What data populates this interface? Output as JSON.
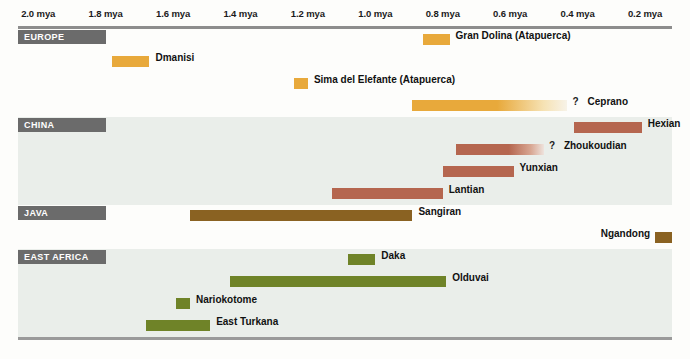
{
  "chart_data": {
    "type": "bar",
    "orientation": "horizontal-timeline",
    "title": "",
    "xlabel": "",
    "ylabel": "",
    "axis": {
      "unit": "mya",
      "ticks": [
        "2.0 mya",
        "1.8 mya",
        "1.6 mya",
        "1.4 mya",
        "1.2 mya",
        "1.0 mya",
        "0.8 mya",
        "0.6 mya",
        "0.4 mya",
        "0.2 mya"
      ],
      "tick_values": [
        2.0,
        1.8,
        1.6,
        1.4,
        1.2,
        1.0,
        0.8,
        0.6,
        0.4,
        0.2
      ],
      "xlim": [
        2.06,
        0.12
      ],
      "direction": "oldest-left",
      "grid": true,
      "legend": "none"
    },
    "colors": {
      "europe": "#e8a93b",
      "china": "#b5664f",
      "java": "#8a6222",
      "east_africa": "#6f8328",
      "section_header": "#6b6b6b",
      "shaded_band": "#eaeeea",
      "plain_band": "#fdfdfb",
      "axis_rule": "#8d8d8d"
    },
    "regions": [
      {
        "name": "EUROPE",
        "shaded": false,
        "color": "#e8a93b",
        "bars": [
          {
            "label": "Gran Dolina (Atapuerca)",
            "start_mya": 0.86,
            "end_mya": 0.78,
            "uncertain": false,
            "label_side": "right"
          },
          {
            "label": "Dmanisi",
            "start_mya": 1.78,
            "end_mya": 1.67,
            "uncertain": false,
            "label_side": "right"
          },
          {
            "label": "Sima del Elefante (Atapuerca)",
            "start_mya": 1.24,
            "end_mya": 1.2,
            "uncertain": false,
            "label_side": "right"
          },
          {
            "label": "Ceprano",
            "start_mya": 0.89,
            "end_mya": 0.43,
            "uncertain": true,
            "label_side": "right"
          }
        ]
      },
      {
        "name": "CHINA",
        "shaded": true,
        "color": "#b5664f",
        "bars": [
          {
            "label": "Hexian",
            "start_mya": 0.41,
            "end_mya": 0.21,
            "uncertain": false,
            "label_side": "right"
          },
          {
            "label": "Zhoukoudian",
            "start_mya": 0.76,
            "end_mya": 0.5,
            "uncertain": true,
            "label_side": "right"
          },
          {
            "label": "Yunxian",
            "start_mya": 0.8,
            "end_mya": 0.59,
            "uncertain": false,
            "label_side": "right"
          },
          {
            "label": "Lantian",
            "start_mya": 1.13,
            "end_mya": 0.8,
            "uncertain": false,
            "label_side": "right"
          }
        ]
      },
      {
        "name": "JAVA",
        "shaded": false,
        "color": "#8a6222",
        "bars": [
          {
            "label": "Sangiran",
            "start_mya": 1.55,
            "end_mya": 0.89,
            "uncertain": false,
            "label_side": "right"
          },
          {
            "label": "Ngandong",
            "start_mya": 0.17,
            "end_mya": 0.12,
            "uncertain": false,
            "label_side": "left"
          }
        ]
      },
      {
        "name": "EAST AFRICA",
        "shaded": true,
        "color": "#6f8328",
        "bars": [
          {
            "label": "Daka",
            "start_mya": 1.08,
            "end_mya": 1.0,
            "uncertain": false,
            "label_side": "right"
          },
          {
            "label": "Olduvai",
            "start_mya": 1.43,
            "end_mya": 0.79,
            "uncertain": false,
            "label_side": "right"
          },
          {
            "label": "Nariokotome",
            "start_mya": 1.59,
            "end_mya": 1.55,
            "uncertain": false,
            "label_side": "right"
          },
          {
            "label": "East Turkana",
            "start_mya": 1.68,
            "end_mya": 1.49,
            "uncertain": false,
            "label_side": "right"
          }
        ]
      }
    ],
    "annotations": [
      {
        "symbol": "?",
        "meaning": "age uncertain / extends further"
      }
    ]
  }
}
